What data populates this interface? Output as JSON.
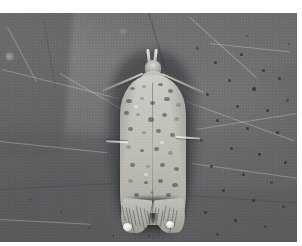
{
  "image": {
    "kind": "photograph",
    "subject": "moth",
    "subject_common_name": "moth",
    "scene": "moth resting on a leaf",
    "color_mode": "grayscale",
    "orientation": "moth facing up, head at top, wingtips at bottom",
    "background_description": "large dark gray leaf surface with pale veins and small dark speckles"
  },
  "colors": {
    "plate_margin": "#ffffff",
    "leaf_light": "#7b7d7e",
    "leaf_mid": "#6e7072",
    "leaf_dark": "#5a5c5e",
    "leaf_vein": "#e9e9e7",
    "leaf_speck": "#1c1e20",
    "moth_wing_light": "#cdcdc6",
    "moth_wing_mid": "#bcbcb5",
    "moth_wing_dark": "#a7a7a0",
    "moth_marking": "#3a3a36",
    "moth_highlight": "#f2f2ee",
    "moth_shadow": "#141618"
  },
  "photo": {
    "left": 0,
    "top": 13,
    "width": 297,
    "height": 229,
    "margin_top": 13,
    "margin_right": 5,
    "margin_bottom": 4
  },
  "moth_parts": [
    {
      "name": "labial-palps",
      "description": "two pale upturned palps at the head"
    },
    {
      "name": "head",
      "description": "small rounded pale head"
    },
    {
      "name": "antenna-left",
      "description": "slender antenna sweeping down and left"
    },
    {
      "name": "antenna-right",
      "description": "slender antenna sweeping down and right"
    },
    {
      "name": "thorax",
      "description": "pale gray thorax"
    },
    {
      "name": "forewings",
      "description": "elongate pale gray forewings with dark speckling"
    },
    {
      "name": "leg-left",
      "description": "pale leg projecting left from mid body"
    },
    {
      "name": "leg-right",
      "description": "pale leg projecting right from mid body"
    },
    {
      "name": "wingtip-left",
      "description": "left terminal wing tip with fringe"
    },
    {
      "name": "wingtip-right",
      "description": "right terminal wing tip with fringe"
    },
    {
      "name": "foot-pads",
      "description": "two bright white foot pads at the wing tips"
    }
  ],
  "leaf_veins": [
    {
      "x": 2,
      "y": 56,
      "len": 120,
      "angle": 14,
      "w": 1.4,
      "tone": "light"
    },
    {
      "x": 8,
      "y": 14,
      "len": 62,
      "angle": 62,
      "w": 1.2,
      "tone": "light"
    },
    {
      "x": 60,
      "y": 60,
      "len": 110,
      "angle": 30,
      "w": 1.0,
      "tone": "light"
    },
    {
      "x": 186,
      "y": 88,
      "len": 115,
      "angle": 20,
      "w": 1.2,
      "tone": "light"
    },
    {
      "x": 190,
      "y": 4,
      "len": 90,
      "angle": 42,
      "w": 1.0,
      "tone": "light"
    },
    {
      "x": 196,
      "y": 116,
      "len": 104,
      "angle": -9,
      "w": 1.0,
      "tone": "light"
    },
    {
      "x": 0,
      "y": 128,
      "len": 108,
      "angle": 6,
      "w": 1.0,
      "tone": "light"
    },
    {
      "x": 192,
      "y": 150,
      "len": 108,
      "angle": 8,
      "w": 1.0,
      "tone": "light"
    },
    {
      "x": 0,
      "y": 176,
      "len": 112,
      "angle": -3,
      "w": 1.2,
      "tone": "dark"
    },
    {
      "x": 190,
      "y": 182,
      "len": 110,
      "angle": 4,
      "w": 1.2,
      "tone": "dark"
    },
    {
      "x": 150,
      "y": 0,
      "len": 58,
      "angle": 74,
      "w": 1.6,
      "tone": "dark"
    },
    {
      "x": 44,
      "y": 6,
      "len": 70,
      "angle": 80,
      "w": 1.4,
      "tone": "dark"
    },
    {
      "x": 210,
      "y": 30,
      "len": 80,
      "angle": 6,
      "w": 0.9,
      "tone": "light"
    },
    {
      "x": 0,
      "y": 206,
      "len": 90,
      "angle": 3,
      "w": 0.9,
      "tone": "light"
    }
  ],
  "leaf_specks": [
    {
      "x": 214,
      "y": 48,
      "r": 1.7
    },
    {
      "x": 240,
      "y": 40,
      "r": 1.5
    },
    {
      "x": 262,
      "y": 56,
      "r": 1.6
    },
    {
      "x": 228,
      "y": 66,
      "r": 1.4
    },
    {
      "x": 252,
      "y": 74,
      "r": 1.8
    },
    {
      "x": 278,
      "y": 64,
      "r": 1.4
    },
    {
      "x": 206,
      "y": 80,
      "r": 1.5
    },
    {
      "x": 236,
      "y": 92,
      "r": 1.7
    },
    {
      "x": 266,
      "y": 96,
      "r": 1.5
    },
    {
      "x": 216,
      "y": 106,
      "r": 1.6
    },
    {
      "x": 246,
      "y": 114,
      "r": 1.4
    },
    {
      "x": 276,
      "y": 118,
      "r": 1.6
    },
    {
      "x": 200,
      "y": 126,
      "r": 1.3
    },
    {
      "x": 230,
      "y": 134,
      "r": 1.6
    },
    {
      "x": 258,
      "y": 140,
      "r": 1.4
    },
    {
      "x": 284,
      "y": 148,
      "r": 1.5
    },
    {
      "x": 210,
      "y": 152,
      "r": 1.4
    },
    {
      "x": 242,
      "y": 160,
      "r": 1.5
    },
    {
      "x": 270,
      "y": 168,
      "r": 1.3
    },
    {
      "x": 222,
      "y": 176,
      "r": 1.5
    },
    {
      "x": 252,
      "y": 186,
      "r": 1.4
    },
    {
      "x": 282,
      "y": 192,
      "r": 1.3
    },
    {
      "x": 204,
      "y": 198,
      "r": 1.4
    },
    {
      "x": 234,
      "y": 206,
      "r": 1.5
    },
    {
      "x": 264,
      "y": 212,
      "r": 1.3
    },
    {
      "x": 196,
      "y": 34,
      "r": 1.3
    },
    {
      "x": 288,
      "y": 30,
      "r": 1.2
    },
    {
      "x": 246,
      "y": 22,
      "r": 1.2
    },
    {
      "x": 216,
      "y": 220,
      "r": 1.3
    },
    {
      "x": 286,
      "y": 86,
      "r": 1.3
    },
    {
      "x": 88,
      "y": 214,
      "r": 1.2
    },
    {
      "x": 60,
      "y": 198,
      "r": 1.1
    },
    {
      "x": 112,
      "y": 222,
      "r": 1.2
    },
    {
      "x": 30,
      "y": 186,
      "r": 1.1
    },
    {
      "x": 148,
      "y": 222,
      "r": 1.2
    },
    {
      "x": 178,
      "y": 214,
      "r": 1.2
    }
  ],
  "wing_markings": [
    {
      "x": 130,
      "y": 74,
      "w": 5,
      "h": 3,
      "k": "mk"
    },
    {
      "x": 142,
      "y": 72,
      "w": 4,
      "h": 3,
      "k": "lite"
    },
    {
      "x": 158,
      "y": 70,
      "w": 5,
      "h": 3,
      "k": "mk"
    },
    {
      "x": 168,
      "y": 76,
      "w": 5,
      "h": 4,
      "k": "mk"
    },
    {
      "x": 126,
      "y": 86,
      "w": 6,
      "h": 4,
      "k": "mk"
    },
    {
      "x": 140,
      "y": 84,
      "w": 4,
      "h": 3,
      "k": "lite"
    },
    {
      "x": 150,
      "y": 88,
      "w": 5,
      "h": 4,
      "k": "mk"
    },
    {
      "x": 164,
      "y": 84,
      "w": 6,
      "h": 4,
      "k": "mk"
    },
    {
      "x": 176,
      "y": 90,
      "w": 5,
      "h": 4,
      "k": "lite"
    },
    {
      "x": 124,
      "y": 98,
      "w": 5,
      "h": 4,
      "k": "mk"
    },
    {
      "x": 136,
      "y": 100,
      "w": 4,
      "h": 3,
      "k": "lite"
    },
    {
      "x": 148,
      "y": 104,
      "w": 6,
      "h": 5,
      "k": "mk"
    },
    {
      "x": 162,
      "y": 100,
      "w": 5,
      "h": 4,
      "k": "mk"
    },
    {
      "x": 174,
      "y": 104,
      "w": 5,
      "h": 4,
      "k": "lite"
    },
    {
      "x": 128,
      "y": 114,
      "w": 5,
      "h": 4,
      "k": "mk"
    },
    {
      "x": 142,
      "y": 118,
      "w": 4,
      "h": 3,
      "k": "lite"
    },
    {
      "x": 156,
      "y": 116,
      "w": 5,
      "h": 4,
      "k": "mk"
    },
    {
      "x": 170,
      "y": 120,
      "w": 5,
      "h": 4,
      "k": "mk"
    },
    {
      "x": 126,
      "y": 132,
      "w": 5,
      "h": 4,
      "k": "lite"
    },
    {
      "x": 140,
      "y": 136,
      "w": 4,
      "h": 3,
      "k": "mk"
    },
    {
      "x": 154,
      "y": 134,
      "w": 5,
      "h": 4,
      "k": "mk"
    },
    {
      "x": 168,
      "y": 138,
      "w": 5,
      "h": 4,
      "k": "lite"
    },
    {
      "x": 130,
      "y": 150,
      "w": 5,
      "h": 4,
      "k": "mk"
    },
    {
      "x": 146,
      "y": 152,
      "w": 4,
      "h": 3,
      "k": "lite"
    },
    {
      "x": 160,
      "y": 150,
      "w": 5,
      "h": 4,
      "k": "mk"
    },
    {
      "x": 174,
      "y": 154,
      "w": 5,
      "h": 4,
      "k": "mk"
    },
    {
      "x": 128,
      "y": 166,
      "w": 5,
      "h": 4,
      "k": "lite"
    },
    {
      "x": 144,
      "y": 168,
      "w": 4,
      "h": 3,
      "k": "mk"
    },
    {
      "x": 158,
      "y": 166,
      "w": 5,
      "h": 4,
      "k": "mk"
    },
    {
      "x": 172,
      "y": 170,
      "w": 6,
      "h": 4,
      "k": "mk"
    },
    {
      "x": 134,
      "y": 180,
      "w": 5,
      "h": 4,
      "k": "mk"
    },
    {
      "x": 150,
      "y": 178,
      "w": 4,
      "h": 3,
      "k": "lite"
    },
    {
      "x": 166,
      "y": 180,
      "w": 5,
      "h": 4,
      "k": "mk"
    },
    {
      "x": 136,
      "y": 196,
      "w": 5,
      "h": 4,
      "k": "mk"
    },
    {
      "x": 162,
      "y": 196,
      "w": 5,
      "h": 4,
      "k": "mk"
    },
    {
      "x": 132,
      "y": 206,
      "w": 4,
      "h": 3,
      "k": "lite"
    },
    {
      "x": 166,
      "y": 206,
      "w": 4,
      "h": 3,
      "k": "lite"
    },
    {
      "x": 134,
      "y": 92,
      "w": 4,
      "h": 3,
      "k": "hi"
    },
    {
      "x": 160,
      "y": 128,
      "w": 4,
      "h": 3,
      "k": "hi"
    },
    {
      "x": 144,
      "y": 160,
      "w": 4,
      "h": 3,
      "k": "hi"
    },
    {
      "x": 152,
      "y": 190,
      "w": 4,
      "h": 3,
      "k": "hi"
    }
  ]
}
